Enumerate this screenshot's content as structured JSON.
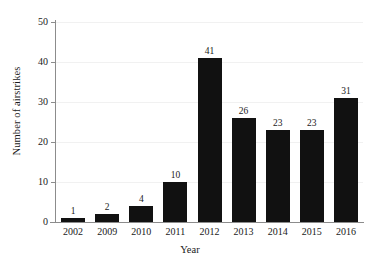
{
  "chart_data": {
    "type": "bar",
    "title": "",
    "subtitle": "",
    "xlabel": "Year",
    "ylabel": "Number of airstrikes",
    "categories": [
      "2002",
      "2009",
      "2010",
      "2011",
      "2012",
      "2013",
      "2014",
      "2015",
      "2016"
    ],
    "values": [
      1,
      2,
      4,
      10,
      41,
      26,
      23,
      23,
      31
    ],
    "data_labels": [
      "1",
      "2",
      "4",
      "10",
      "41",
      "26",
      "23",
      "23",
      "31"
    ],
    "ylim": [
      0,
      50
    ],
    "yticks": [
      0,
      10,
      20,
      30,
      40,
      50
    ],
    "ytick_labels": [
      "0",
      "10",
      "20",
      "30",
      "40",
      "50"
    ],
    "grid": true,
    "grid_axis": "y",
    "legend": false,
    "legend_position": "none",
    "bar_color": "#111111",
    "grid_color": "#f1f1f1",
    "axis_color": "#8c8c8c",
    "background_color": "#ffffff",
    "text_color": "#1a1a1a"
  }
}
